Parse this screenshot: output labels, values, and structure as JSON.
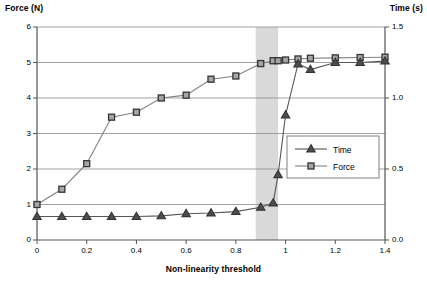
{
  "chart_data": {
    "type": "line",
    "title": "",
    "xlabel": "Non-linearity threshold",
    "ylabel": "Force (N)",
    "y2label": "Time (s)",
    "xlim": [
      0,
      1.4
    ],
    "ylim": [
      0,
      6
    ],
    "y2lim": [
      0,
      1.5
    ],
    "grid": true,
    "xticks": [
      "0",
      "0.2",
      "0.4",
      "0.6",
      "0.8",
      "1",
      "1.2",
      "1.4"
    ],
    "xtick_values": [
      0,
      0.2,
      0.4,
      0.6,
      0.8,
      1.0,
      1.2,
      1.4
    ],
    "yticks": [
      "0",
      "1",
      "2",
      "3",
      "4",
      "5",
      "6"
    ],
    "ytick_values": [
      0,
      1,
      2,
      3,
      4,
      5,
      6
    ],
    "y2ticks": [
      "0.0",
      "0.5",
      "1.0",
      "1.5"
    ],
    "y2tick_values": [
      0.0,
      0.5,
      1.0,
      1.5
    ],
    "legend_position": "center-right-inside",
    "shaded_band": {
      "x_start": 0.88,
      "x_end": 0.97,
      "color": "#d9d9d9"
    },
    "series": [
      {
        "name": "Force",
        "axis": "left",
        "marker": "square",
        "color": "#808080",
        "marker_fill": "#a6a6a6",
        "x": [
          0,
          0.1,
          0.2,
          0.3,
          0.4,
          0.5,
          0.6,
          0.7,
          0.8,
          0.9,
          0.95,
          0.97,
          1.0,
          1.05,
          1.1,
          1.2,
          1.3,
          1.4
        ],
        "values": [
          1.0,
          1.43,
          2.15,
          3.46,
          3.6,
          4.0,
          4.08,
          4.53,
          4.62,
          4.97,
          5.05,
          5.05,
          5.07,
          5.1,
          5.12,
          5.13,
          5.14,
          5.15
        ]
      },
      {
        "name": "Time",
        "axis": "right",
        "marker": "triangle",
        "color": "#555555",
        "marker_fill": "#4d4d4d",
        "x": [
          0,
          0.1,
          0.2,
          0.3,
          0.4,
          0.5,
          0.6,
          0.7,
          0.8,
          0.9,
          0.95,
          0.97,
          1.0,
          1.05,
          1.1,
          1.2,
          1.3,
          1.4
        ],
        "values": [
          0.165,
          0.165,
          0.165,
          0.165,
          0.165,
          0.17,
          0.185,
          0.19,
          0.2,
          0.23,
          0.26,
          0.46,
          0.88,
          1.24,
          1.2,
          1.25,
          1.25,
          1.26
        ]
      }
    ],
    "legend": [
      {
        "label": "Time",
        "marker": "triangle"
      },
      {
        "label": "Force",
        "marker": "square"
      }
    ]
  }
}
